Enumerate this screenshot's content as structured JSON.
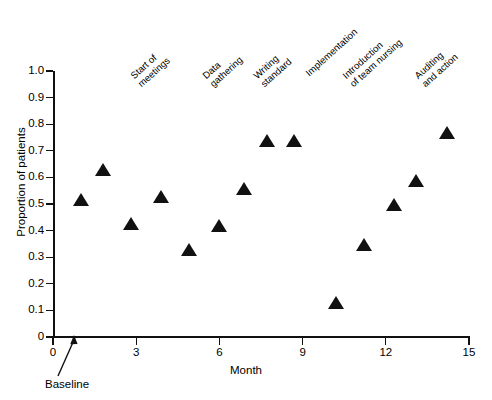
{
  "chart_data": {
    "type": "scatter",
    "title": "",
    "subtitle": "",
    "xlabel": "Month",
    "ylabel": "Proportion of patients",
    "xlim": [
      0,
      15
    ],
    "ylim": [
      0,
      1.0
    ],
    "xticks": [
      "0",
      "3",
      "6",
      "9",
      "12",
      "15"
    ],
    "xtick_values": [
      0,
      3,
      6,
      9,
      12,
      15
    ],
    "yticks": [
      "0",
      "0.1",
      "0.2",
      "0.3",
      "0.4",
      "0.5",
      "0.6",
      "0.7",
      "0.8",
      "0.9",
      "1.0"
    ],
    "ytick_values": [
      0,
      0.1,
      0.2,
      0.3,
      0.4,
      0.5,
      0.6,
      0.7,
      0.8,
      0.9,
      1.0
    ],
    "grid": false,
    "legend": null,
    "marker_shape": "triangle-up",
    "marker_color": "#111111",
    "series": [
      {
        "name": "Proportion of patients",
        "points": [
          {
            "x": 1.0,
            "y": 0.51
          },
          {
            "x": 1.8,
            "y": 0.62
          },
          {
            "x": 2.8,
            "y": 0.42
          },
          {
            "x": 3.9,
            "y": 0.52
          },
          {
            "x": 4.9,
            "y": 0.32
          },
          {
            "x": 6.0,
            "y": 0.41
          },
          {
            "x": 6.9,
            "y": 0.55
          },
          {
            "x": 7.7,
            "y": 0.73
          },
          {
            "x": 8.7,
            "y": 0.73
          },
          {
            "x": 10.2,
            "y": 0.12
          },
          {
            "x": 11.2,
            "y": 0.34
          },
          {
            "x": 12.3,
            "y": 0.49
          },
          {
            "x": 13.1,
            "y": 0.58
          },
          {
            "x": 14.2,
            "y": 0.76
          }
        ]
      }
    ],
    "annotations": [
      {
        "name": "start-of-meetings",
        "text": "Start of\nmeetings",
        "x_px": 143,
        "y_px": 68
      },
      {
        "name": "data-gathering",
        "text": "Data\ngathering",
        "x_px": 215,
        "y_px": 68
      },
      {
        "name": "writing-standard",
        "text": "Writing\nstandard",
        "x_px": 266,
        "y_px": 68
      },
      {
        "name": "implementation",
        "text": "Implementation",
        "x_px": 311,
        "y_px": 68
      },
      {
        "name": "introduction-of-team-nursing",
        "text": "Introduction\nof team nursing",
        "x_px": 355,
        "y_px": 68
      },
      {
        "name": "auditing-and-action",
        "text": "Auditing\nand action",
        "x_px": 427,
        "y_px": 68
      }
    ],
    "callout": {
      "label": "Baseline",
      "points_to_x": 1.0,
      "points_to_y": 0.0
    }
  }
}
